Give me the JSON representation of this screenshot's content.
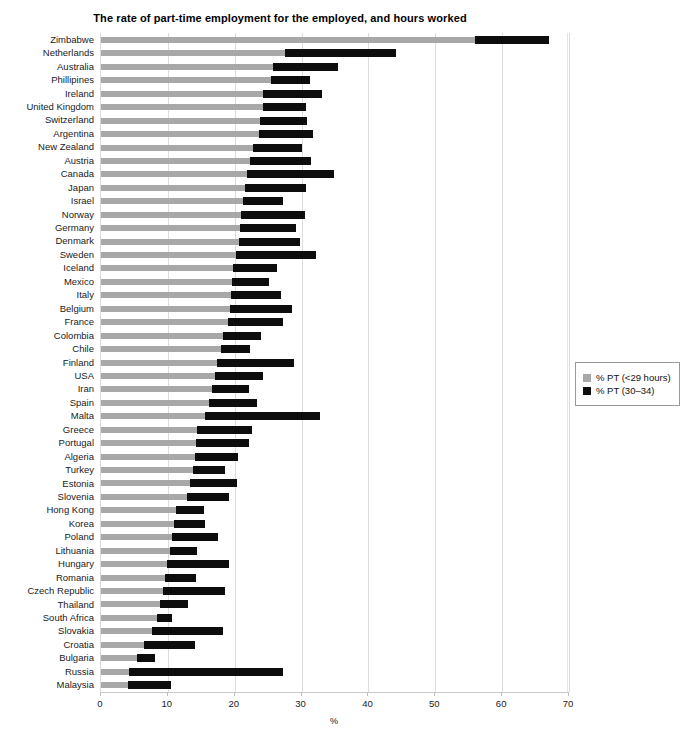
{
  "chart_data": {
    "type": "bar",
    "orientation": "horizontal",
    "stacked": true,
    "title": "The rate of part-time employment for the employed, and hours worked",
    "xlabel": "%",
    "ylabel": "",
    "xlim": [
      0,
      70
    ],
    "xticks": [
      0,
      10,
      20,
      30,
      40,
      50,
      60,
      70
    ],
    "grid": "vertical",
    "legend_position": "right",
    "colors": {
      "series1": "#a8a8a8",
      "series2": "#0d0d0d",
      "grid": "#dcdcdc",
      "background": "#ffffff"
    },
    "categories": [
      "Zimbabwe",
      "Netherlands",
      "Australia",
      "Phillipines",
      "Ireland",
      "United Kingdom",
      "Switzerland",
      "Argentina",
      "New Zealand",
      "Austria",
      "Canada",
      "Japan",
      "Israel",
      "Norway",
      "Germany",
      "Denmark",
      "Sweden",
      "Iceland",
      "Mexico",
      "Italy",
      "Belgium",
      "France",
      "Colombia",
      "Chile",
      "Finland",
      "USA",
      "Iran",
      "Spain",
      "Malta",
      "Greece",
      "Portugal",
      "Algeria",
      "Turkey",
      "Estonia",
      "Slovenia",
      "Hong Kong",
      "Korea",
      "Poland",
      "Lithuania",
      "Hungary",
      "Romania",
      "Czech Republic",
      "Thailand",
      "South Africa",
      "Slovakia",
      "Croatia",
      "Bulgaria",
      "Russia",
      "Malaysia"
    ],
    "series": [
      {
        "name": "% PT (<29 hours)",
        "color": "#a8a8a8",
        "values": [
          56.0,
          27.5,
          25.7,
          25.5,
          24.3,
          24.2,
          23.8,
          23.6,
          22.8,
          22.3,
          21.8,
          21.5,
          21.2,
          21.0,
          20.8,
          20.6,
          20.2,
          19.8,
          19.6,
          19.5,
          19.3,
          19.0,
          18.2,
          18.0,
          17.4,
          17.0,
          16.6,
          16.2,
          15.6,
          14.4,
          14.2,
          14.0,
          13.7,
          13.3,
          12.8,
          11.2,
          10.9,
          10.6,
          10.3,
          9.9,
          9.6,
          9.3,
          8.8,
          8.4,
          7.6,
          6.5,
          5.4,
          4.2,
          4.0
        ]
      },
      {
        "name": "% PT (30–34)",
        "color": "#0d0d0d",
        "values": [
          11.0,
          16.6,
          9.8,
          5.7,
          8.7,
          6.5,
          7.0,
          8.1,
          7.2,
          9.1,
          13.0,
          9.2,
          6.0,
          9.5,
          8.4,
          9.2,
          12.0,
          6.5,
          5.6,
          7.4,
          9.3,
          8.2,
          5.8,
          4.3,
          11.4,
          7.3,
          5.6,
          7.2,
          17.1,
          8.2,
          7.9,
          6.5,
          4.9,
          7.1,
          6.3,
          4.2,
          4.6,
          6.9,
          4.1,
          9.2,
          4.6,
          9.2,
          4.2,
          2.2,
          10.6,
          7.5,
          2.7,
          23.0,
          6.5
        ]
      }
    ],
    "totals": [
      67.0,
      44.1,
      35.5,
      31.2,
      33.0,
      30.7,
      30.8,
      31.7,
      30.0,
      31.4,
      34.8,
      30.7,
      27.2,
      30.5,
      29.2,
      29.8,
      32.2,
      26.3,
      25.2,
      26.9,
      28.6,
      27.2,
      24.0,
      22.3,
      28.8,
      24.3,
      22.2,
      23.4,
      32.7,
      22.6,
      22.1,
      20.5,
      18.6,
      20.4,
      19.1,
      15.4,
      15.5,
      17.5,
      14.4,
      19.1,
      14.2,
      18.5,
      13.0,
      10.6,
      18.2,
      14.0,
      8.1,
      27.2,
      10.5
    ]
  },
  "legend": {
    "items": [
      {
        "label": "% PT (<29 hours)",
        "color": "#a8a8a8"
      },
      {
        "label": "% PT (30–34)",
        "color": "#0d0d0d"
      }
    ]
  }
}
